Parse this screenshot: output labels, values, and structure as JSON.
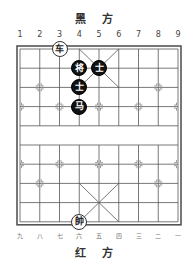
{
  "board": {
    "top_side": "黑 方",
    "bottom_side": "红 方",
    "top_column_labels": [
      "1",
      "2",
      "3",
      "4",
      "5",
      "6",
      "7",
      "8",
      "9"
    ],
    "bottom_column_labels": [
      "九",
      "八",
      "七",
      "六",
      "五",
      "四",
      "三",
      "二",
      "一"
    ]
  },
  "pieces": [
    {
      "char": "车",
      "side": "red",
      "col": 3,
      "row": 0
    },
    {
      "char": "将",
      "side": "black",
      "col": 4,
      "row": 1
    },
    {
      "char": "士",
      "side": "black",
      "col": 5,
      "row": 1
    },
    {
      "char": "士",
      "side": "black",
      "col": 4,
      "row": 2
    },
    {
      "char": "马",
      "side": "black",
      "col": 4,
      "row": 3
    },
    {
      "char": "帥",
      "side": "red",
      "col": 4,
      "row": 9
    }
  ]
}
